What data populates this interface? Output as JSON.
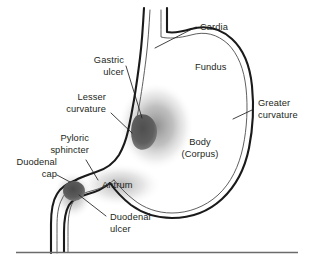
{
  "figure": {
    "background_color": "#ffffff",
    "text_color": "#231f20",
    "outline_color": "#1a1a1a",
    "inner_wall_color": "#4d4d4d",
    "ulcer_color": "#595959",
    "shading_color": "#9a9a9a",
    "rule_color": "#6b6b6b"
  },
  "labels": {
    "cardia": "Cardia",
    "fundus": "Fundus",
    "greater_curvature_line1": "Greater",
    "greater_curvature_line2": "curvature",
    "body_line1": "Body",
    "body_line2": "(Corpus)",
    "gastric_ulcer_line1": "Gastric",
    "gastric_ulcer_line2": "ulcer",
    "lesser_curvature_line1": "Lesser",
    "lesser_curvature_line2": "curvature",
    "pyloric_sphincter_line1": "Pyloric",
    "pyloric_sphincter_line2": "sphincter",
    "duodenal_cap_line1": "Duodenal",
    "duodenal_cap_line2": "cap",
    "antrum": "Antrum",
    "duodenal_ulcer_line1": "Duodenal",
    "duodenal_ulcer_line2": "ulcer"
  }
}
